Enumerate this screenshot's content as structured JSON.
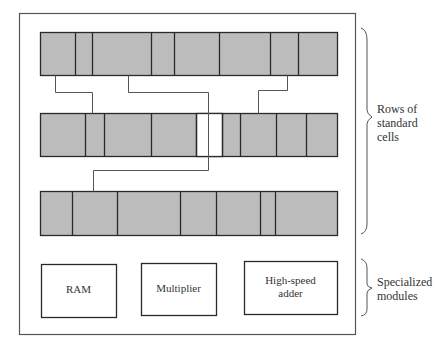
{
  "colors": {
    "cell_fill": "#bcbcbc",
    "cell_stroke": "#2a2a2a",
    "wire": "#555555",
    "outline": "#555555",
    "white_cell": "#ffffff"
  },
  "chip": {
    "rows": [
      {
        "name": "row-1",
        "x": 40,
        "y": 32,
        "w": 297,
        "h": 43,
        "dividers": [
          75,
          92,
          151,
          174,
          219,
          270,
          298
        ],
        "white_cells": []
      },
      {
        "name": "row-2",
        "x": 40,
        "y": 113,
        "w": 297,
        "h": 43,
        "dividers": [
          85,
          104,
          151,
          196,
          222,
          240,
          276,
          306
        ],
        "white_cells": [
          [
            196,
            222
          ]
        ]
      },
      {
        "name": "row-3",
        "x": 40,
        "y": 191,
        "w": 297,
        "h": 44,
        "dividers": [
          72,
          117,
          180,
          216,
          260,
          275
        ],
        "white_cells": []
      }
    ],
    "wires": [
      {
        "name": "wire-1",
        "points": [
          [
            55,
            75
          ],
          [
            55,
            92
          ],
          [
            92,
            92
          ],
          [
            92,
            113
          ]
        ]
      },
      {
        "name": "wire-2",
        "points": [
          [
            128,
            75
          ],
          [
            128,
            92
          ],
          [
            208,
            92
          ],
          [
            208,
            170
          ],
          [
            93,
            170
          ],
          [
            93,
            191
          ]
        ]
      },
      {
        "name": "wire-3",
        "points": [
          [
            287,
            75
          ],
          [
            287,
            90
          ],
          [
            258,
            90
          ],
          [
            258,
            113
          ]
        ]
      }
    ],
    "modules": [
      {
        "name": "ram",
        "label": "RAM",
        "x": 41,
        "y": 264,
        "w": 75,
        "h": 53
      },
      {
        "name": "multiplier",
        "label": "Multiplier",
        "x": 141,
        "y": 263,
        "w": 75,
        "h": 52
      },
      {
        "name": "high-speed-adder",
        "label_line1": "High-speed",
        "label_line2": "adder",
        "x": 244,
        "y": 261,
        "w": 93,
        "h": 53
      }
    ]
  },
  "annotations": {
    "rows_label": [
      "Rows of",
      "standard",
      "cells"
    ],
    "modules_label": [
      "Specialized",
      "modules"
    ]
  }
}
